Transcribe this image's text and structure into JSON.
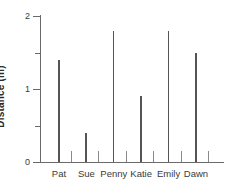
{
  "chart_data": {
    "type": "bar",
    "title": "",
    "xlabel": "",
    "ylabel": "Distance (m)",
    "categories": [
      "Pat",
      "Sue",
      "Penny",
      "Katie",
      "Emily",
      "Dawn"
    ],
    "values": [
      1.4,
      0.4,
      1.8,
      0.9,
      1.8,
      1.5
    ],
    "ylim": [
      0,
      2
    ],
    "yticks": [
      0,
      1,
      2
    ],
    "ytick_labels": [
      "0",
      "1",
      "2"
    ],
    "yminor_ticks": [
      0.5,
      1.5
    ],
    "grid": false,
    "legend": null,
    "bar_style": "thin-line",
    "colors": {
      "bar": "#555555",
      "axis": "#6a6a6a",
      "text": "#3a3a3a",
      "background": "#ffffff"
    }
  }
}
